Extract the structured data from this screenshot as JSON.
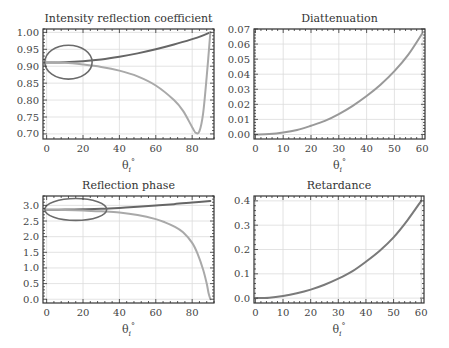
{
  "chart_data": [
    {
      "id": "intensity",
      "type": "line",
      "title": "Intensity reflection coefficient",
      "xlabel": "θi°",
      "ylabel": "",
      "xlim": [
        -2,
        92
      ],
      "ylim": [
        0.685,
        1.01
      ],
      "xticks": [
        0,
        20,
        40,
        60,
        80
      ],
      "yticks": [
        0.7,
        0.75,
        0.8,
        0.85,
        0.9,
        0.95,
        1.0
      ],
      "ytick_labels": [
        "0.70",
        "0.75",
        "0.80",
        "0.85",
        "0.90",
        "0.95",
        "1.00"
      ],
      "grid": true,
      "frame": {
        "x": 43,
        "y": 29,
        "w": 171,
        "h": 110
      },
      "annotation": {
        "type": "ellipse",
        "cx": 12,
        "cy": 0.912,
        "rx_data": 13,
        "ry_data": 0.05
      },
      "series": [
        {
          "name": "Rs",
          "color": "#666666",
          "x": [
            0,
            10,
            20,
            30,
            40,
            50,
            60,
            70,
            80,
            85,
            90
          ],
          "y": [
            0.911,
            0.912,
            0.915,
            0.92,
            0.928,
            0.938,
            0.95,
            0.964,
            0.98,
            0.989,
            1.0
          ]
        },
        {
          "name": "Rp",
          "color": "#a9a9a9",
          "x": [
            0,
            10,
            20,
            30,
            40,
            50,
            60,
            70,
            75,
            80,
            82,
            84,
            86,
            88,
            90
          ],
          "y": [
            0.911,
            0.91,
            0.905,
            0.898,
            0.887,
            0.87,
            0.843,
            0.8,
            0.768,
            0.72,
            0.703,
            0.708,
            0.76,
            0.87,
            1.0
          ]
        }
      ]
    },
    {
      "id": "diattenuation",
      "type": "line",
      "title": "Diattenuation",
      "xlabel": "θi°",
      "ylabel": "",
      "xlim": [
        -0.5,
        61
      ],
      "ylim": [
        -0.003,
        0.07
      ],
      "xticks": [
        0,
        10,
        20,
        30,
        40,
        50,
        60
      ],
      "yticks": [
        0.0,
        0.01,
        0.02,
        0.03,
        0.04,
        0.05,
        0.06,
        0.07
      ],
      "ytick_labels": [
        "0.00",
        "0.01",
        "0.02",
        "0.03",
        "0.04",
        "0.05",
        "0.06",
        "0.07"
      ],
      "grid": true,
      "frame": {
        "x": 254,
        "y": 29,
        "w": 171,
        "h": 110
      },
      "series": [
        {
          "name": "D",
          "color": "#999999",
          "x": [
            0,
            5,
            10,
            15,
            20,
            25,
            30,
            35,
            40,
            45,
            50,
            55,
            60
          ],
          "y": [
            0.0,
            0.0003,
            0.0013,
            0.003,
            0.0058,
            0.009,
            0.0135,
            0.019,
            0.0255,
            0.033,
            0.042,
            0.053,
            0.067
          ]
        }
      ]
    },
    {
      "id": "phase",
      "type": "line",
      "title": "Reflection phase",
      "xlabel": "θi°",
      "ylabel": "",
      "xlim": [
        -2,
        92
      ],
      "ylim": [
        -0.12,
        3.3
      ],
      "xticks": [
        0,
        20,
        40,
        60,
        80
      ],
      "yticks": [
        0.0,
        0.5,
        1.0,
        1.5,
        2.0,
        2.5,
        3.0
      ],
      "ytick_labels": [
        "0.0",
        "0.5",
        "1.0",
        "1.5",
        "2.0",
        "2.5",
        "3.0"
      ],
      "grid": true,
      "frame": {
        "x": 43,
        "y": 196,
        "w": 171,
        "h": 107
      },
      "annotation": {
        "type": "ellipse",
        "cx": 16,
        "cy": 2.87,
        "rx_data": 17,
        "ry_data": 0.35
      },
      "series": [
        {
          "name": "phi_s",
          "color": "#666666",
          "x": [
            0,
            10,
            20,
            30,
            40,
            50,
            60,
            70,
            80,
            90
          ],
          "y": [
            2.86,
            2.865,
            2.875,
            2.89,
            2.92,
            2.96,
            3.0,
            3.04,
            3.09,
            3.14
          ]
        },
        {
          "name": "phi_p",
          "color": "#a9a9a9",
          "x": [
            0,
            10,
            20,
            30,
            40,
            50,
            60,
            65,
            70,
            75,
            80,
            83,
            86,
            88,
            89,
            90
          ],
          "y": [
            2.86,
            2.855,
            2.84,
            2.81,
            2.77,
            2.69,
            2.56,
            2.46,
            2.33,
            2.14,
            1.8,
            1.45,
            0.95,
            0.5,
            0.2,
            0.0
          ]
        }
      ]
    },
    {
      "id": "retardance",
      "type": "line",
      "title": "Retardance",
      "xlabel": "θi°",
      "ylabel": "",
      "xlim": [
        -0.5,
        61
      ],
      "ylim": [
        -0.02,
        0.42
      ],
      "xticks": [
        0,
        10,
        20,
        30,
        40,
        50,
        60
      ],
      "yticks": [
        0.0,
        0.1,
        0.2,
        0.3,
        0.4
      ],
      "ytick_labels": [
        "0.0",
        "0.1",
        "0.2",
        "0.3",
        "0.4"
      ],
      "grid": true,
      "frame": {
        "x": 254,
        "y": 196,
        "w": 170,
        "h": 107
      },
      "series": [
        {
          "name": "delta",
          "color": "#7a7a7a",
          "x": [
            0,
            5,
            10,
            15,
            20,
            25,
            30,
            35,
            40,
            45,
            50,
            55,
            60
          ],
          "y": [
            0.0,
            0.002,
            0.009,
            0.02,
            0.035,
            0.055,
            0.08,
            0.11,
            0.15,
            0.195,
            0.25,
            0.32,
            0.4
          ]
        }
      ]
    }
  ]
}
